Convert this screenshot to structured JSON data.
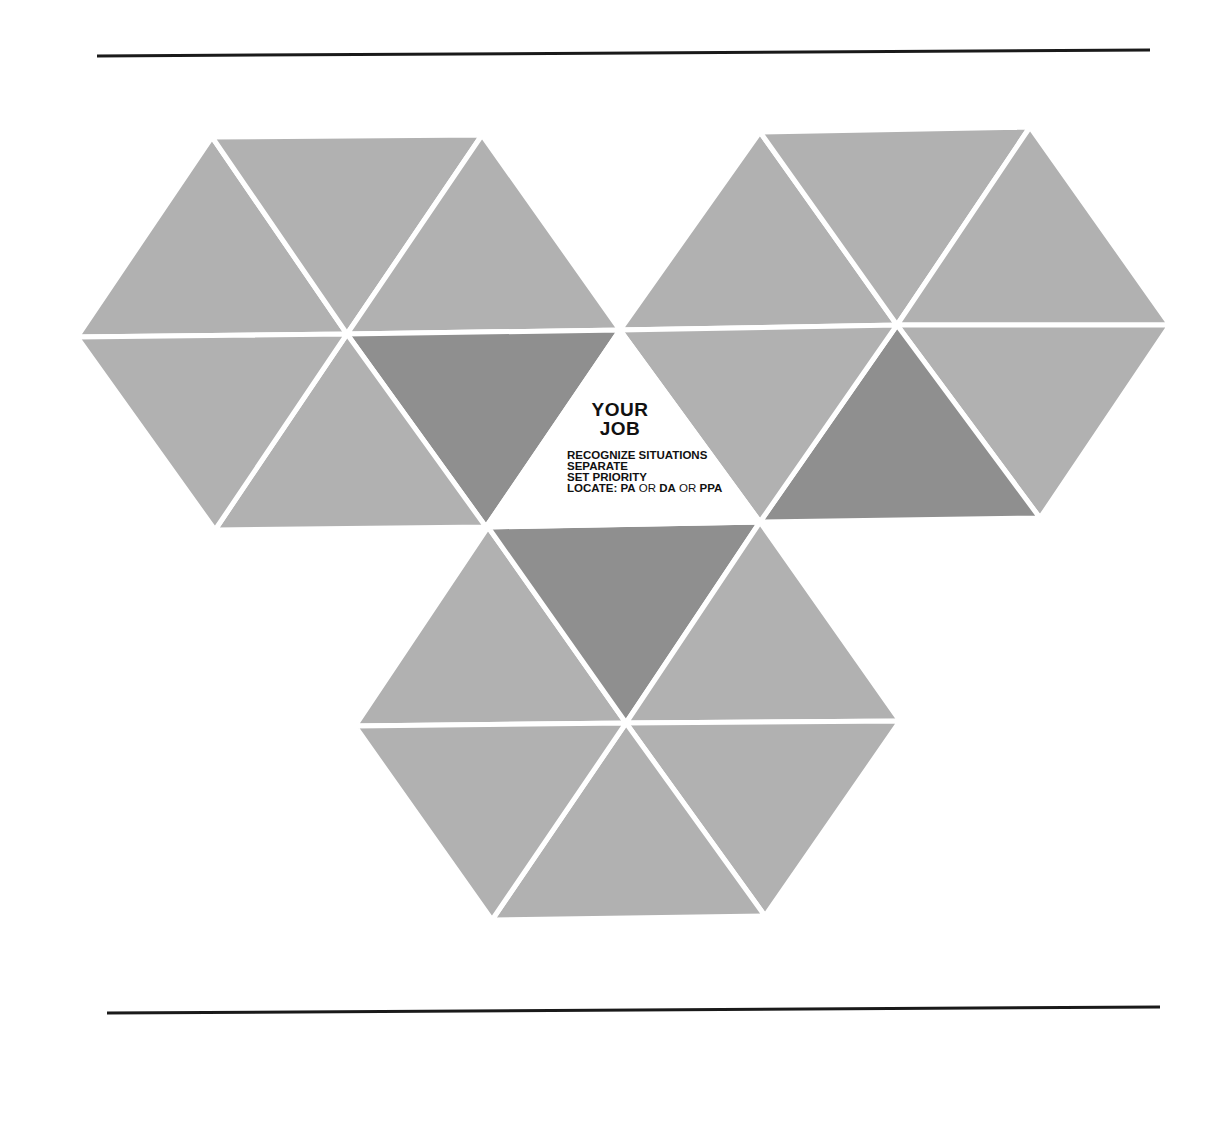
{
  "rules": {
    "top": {
      "x1": 97,
      "y1": 56,
      "x2": 1150,
      "y2": 50
    },
    "bottom": {
      "x1": 107,
      "y1": 1013,
      "x2": 1160,
      "y2": 1007
    }
  },
  "colors": {
    "light": "#b1b1b1",
    "dark": "#8f8f8f",
    "center": "#ffffff",
    "gap": "#ffffff",
    "rule": "#1a1a1a"
  },
  "hexagons": [
    {
      "name": "left",
      "center": [
        347,
        334
      ],
      "vertices": [
        [
          77,
          337
        ],
        [
          212,
          137
        ],
        [
          482,
          135
        ],
        [
          620,
          330
        ],
        [
          486,
          527
        ],
        [
          215,
          530
        ]
      ],
      "dark_triangles": [
        3
      ]
    },
    {
      "name": "right",
      "center": [
        897,
        325
      ],
      "vertices": [
        [
          620,
          330
        ],
        [
          760,
          132
        ],
        [
          1030,
          127
        ],
        [
          1170,
          325
        ],
        [
          1040,
          518
        ],
        [
          760,
          522
        ]
      ],
      "dark_triangles": [
        4
      ]
    },
    {
      "name": "bottom",
      "center": [
        626,
        723
      ],
      "vertices": [
        [
          355,
          726
        ],
        [
          488,
          527
        ],
        [
          760,
          522
        ],
        [
          900,
          721
        ],
        [
          765,
          916
        ],
        [
          492,
          920
        ]
      ],
      "dark_triangles": [
        1
      ]
    }
  ],
  "center": {
    "title_line1": "YOUR",
    "title_line2": "JOB",
    "items": [
      "RECOGNIZE SITUATIONS",
      "SEPARATE",
      "SET PRIORITY"
    ],
    "locate": {
      "label": "LOCATE: PA",
      "or1": " OR ",
      "da": "DA",
      "or2": " OR ",
      "ppa": "PPA"
    }
  }
}
